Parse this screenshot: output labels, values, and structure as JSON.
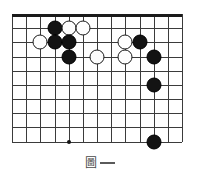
{
  "figure": {
    "kind": "go-board-diagram",
    "caption_glyph": "圖",
    "caption_dash": "—",
    "caption_full": "圖—"
  },
  "board": {
    "columns": 13,
    "rows": 10,
    "cell_size": 14.17,
    "origin_x": 12,
    "origin_y": 14,
    "line_color": "#3b3b3b",
    "edge_color": "#1a1a1a",
    "background": "#ffffff",
    "top_edge_is_border": true,
    "star_points": [
      {
        "col": 4,
        "row": 9
      }
    ]
  },
  "stones": [
    {
      "color": "black",
      "col": 3,
      "row": 1
    },
    {
      "color": "white",
      "col": 4,
      "row": 1
    },
    {
      "color": "white",
      "col": 5,
      "row": 1
    },
    {
      "color": "white",
      "col": 2,
      "row": 2
    },
    {
      "color": "black",
      "col": 3,
      "row": 2
    },
    {
      "color": "black",
      "col": 4,
      "row": 2
    },
    {
      "color": "white",
      "col": 8,
      "row": 2
    },
    {
      "color": "black",
      "col": 9,
      "row": 2
    },
    {
      "color": "black",
      "col": 4,
      "row": 3
    },
    {
      "color": "white",
      "col": 6,
      "row": 3
    },
    {
      "color": "white",
      "col": 8,
      "row": 3
    },
    {
      "color": "black",
      "col": 10,
      "row": 3
    },
    {
      "color": "black",
      "col": 10,
      "row": 5
    },
    {
      "color": "black",
      "col": 10,
      "row": 9
    }
  ],
  "counts": {
    "black_stones": 8,
    "white_stones": 6,
    "total_stones": 14
  },
  "colors": {
    "black_stone": "#131313",
    "white_stone": "#fdfdfd",
    "white_stone_border": "#1b1b1b",
    "grid": "#3b3b3b",
    "caption": "#4a4a4a"
  }
}
